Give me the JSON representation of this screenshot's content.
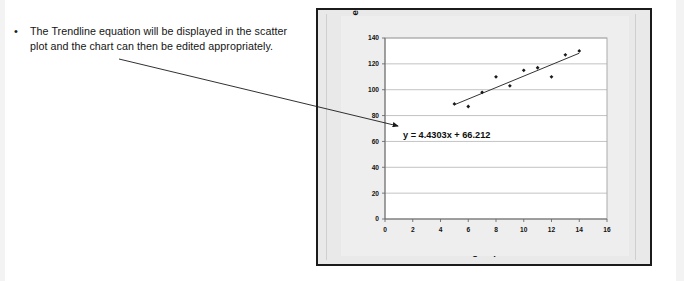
{
  "slide": {
    "bullet_marker": "•",
    "bullet_text": "The Trendline equation will be displayed in the scatter plot and the chart can then be edited appropriately."
  },
  "chart_data": {
    "type": "scatter",
    "title": "",
    "xlabel": "Advertising Expenditure",
    "ylabel": "Sales Volume",
    "xlim": [
      0,
      16
    ],
    "ylim": [
      0,
      140
    ],
    "xticks": [
      0,
      2,
      4,
      6,
      8,
      10,
      12,
      14,
      16
    ],
    "yticks": [
      0,
      20,
      40,
      60,
      80,
      100,
      120,
      140
    ],
    "grid": "horizontal",
    "legend": "none",
    "x": [
      5,
      6,
      7,
      8,
      9,
      10,
      11,
      12,
      13,
      14
    ],
    "y": [
      89,
      87,
      98,
      110,
      103,
      115,
      117,
      110,
      127,
      130
    ],
    "series": [
      {
        "name": "Sales Volume",
        "x": [
          5,
          6,
          7,
          8,
          9,
          10,
          11,
          12,
          13,
          14
        ],
        "values": [
          89,
          87,
          98,
          110,
          103,
          115,
          117,
          110,
          127,
          130
        ],
        "marker": "diamond",
        "color": "#1a1a1a"
      }
    ],
    "trendline": {
      "type": "linear",
      "slope": 4.4303,
      "intercept": 66.212,
      "equation": "y = 4.4303x + 66.212",
      "x_start": 5,
      "x_end": 14,
      "color": "#333333"
    },
    "annotations": [
      {
        "name": "trendline-equation",
        "text": "y = 4.4303x + 66.212",
        "x": 1.0,
        "y": 70
      }
    ]
  },
  "colors": {
    "frame_border": "#1b1b1b",
    "chart_background": "#e9e9e9",
    "plot_background": "#ffffff",
    "gridline": "#a8a8a8",
    "axis": "#5a5a5a",
    "marker": "#1a1a1a",
    "trendline": "#333333",
    "text": "#141414"
  }
}
